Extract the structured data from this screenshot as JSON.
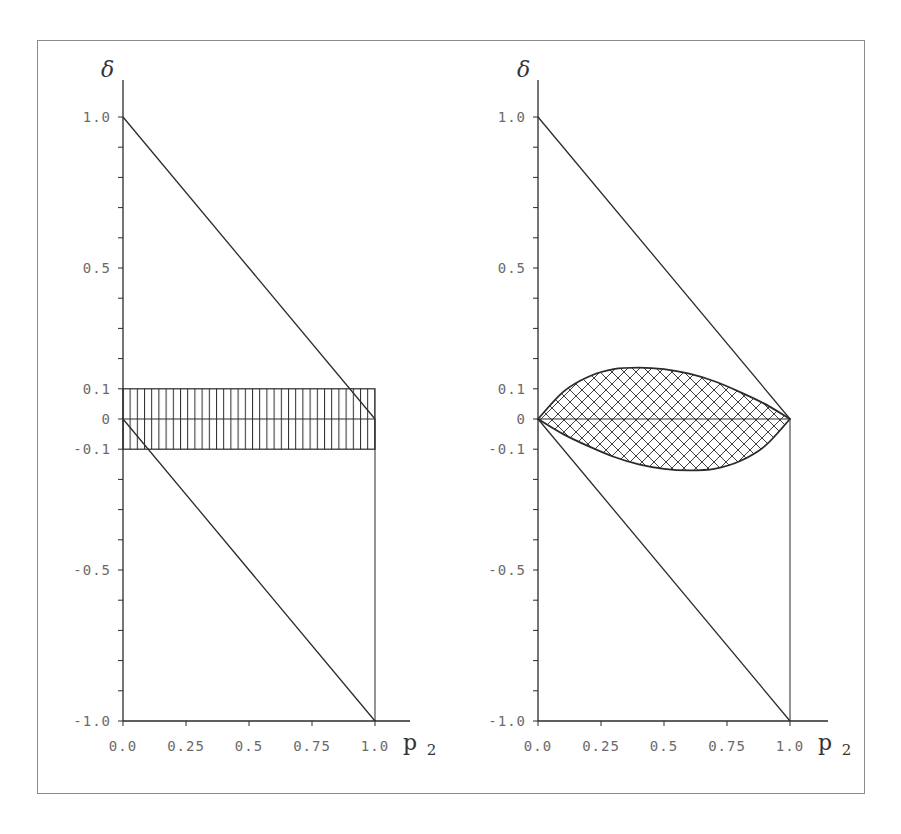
{
  "chart_data": [
    {
      "type": "area",
      "panel": "left",
      "title": "",
      "xlabel": "p2",
      "ylabel": "δ",
      "xlim": [
        0.0,
        1.0
      ],
      "ylim": [
        -1.0,
        1.0
      ],
      "xticks": [
        "0.0",
        "0.25",
        "0.5",
        "0.75",
        "1.0"
      ],
      "yticks_labeled": [
        "1.0",
        "0.5",
        "0.1",
        "0",
        "-0.1",
        "-0.5",
        "-1.0"
      ],
      "ytick_step": 0.1,
      "grid": false,
      "series": [
        {
          "name": "upper bound line",
          "x": [
            0.0,
            1.0
          ],
          "y": [
            1.0,
            0.0
          ]
        },
        {
          "name": "lower bound line",
          "x": [
            0.0,
            1.0
          ],
          "y": [
            0.0,
            -1.0
          ]
        },
        {
          "name": "zero line",
          "x": [
            0.0,
            1.0
          ],
          "y": [
            0.0,
            0.0
          ]
        },
        {
          "name": "vertical line p2=1",
          "x": [
            1.0,
            1.0
          ],
          "y": [
            0.0,
            -1.0
          ]
        }
      ],
      "shaded_regions": [
        {
          "name": "rectangular band (vertical hatch)",
          "shape": "rectangle",
          "x": [
            0.0,
            1.0
          ],
          "y": [
            -0.1,
            0.1
          ],
          "hatch": "vertical"
        }
      ]
    },
    {
      "type": "area",
      "panel": "right",
      "title": "",
      "xlabel": "p2",
      "ylabel": "δ",
      "xlim": [
        0.0,
        1.0
      ],
      "ylim": [
        -1.0,
        1.0
      ],
      "xticks": [
        "0.0",
        "0.25",
        "0.5",
        "0.75",
        "1.0"
      ],
      "yticks_labeled": [
        "1.0",
        "0.5",
        "0.1",
        "0",
        "-0.1",
        "-0.5",
        "-1.0"
      ],
      "ytick_step": 0.1,
      "grid": false,
      "series": [
        {
          "name": "upper bound line",
          "x": [
            0.0,
            1.0
          ],
          "y": [
            1.0,
            0.0
          ]
        },
        {
          "name": "lower bound line",
          "x": [
            0.0,
            1.0
          ],
          "y": [
            0.0,
            -1.0
          ]
        },
        {
          "name": "zero line",
          "x": [
            0.0,
            1.0
          ],
          "y": [
            0.0,
            0.0
          ]
        },
        {
          "name": "vertical line p2=1",
          "x": [
            1.0,
            1.0
          ],
          "y": [
            0.0,
            -1.0
          ]
        },
        {
          "name": "lens upper curve",
          "x": [
            0.0,
            0.1,
            0.2,
            0.3,
            0.4,
            0.5,
            0.6,
            0.7,
            0.8,
            0.9,
            1.0
          ],
          "y": [
            0.0,
            0.09,
            0.14,
            0.165,
            0.17,
            0.165,
            0.15,
            0.125,
            0.09,
            0.05,
            0.0
          ]
        },
        {
          "name": "lens lower curve",
          "x": [
            0.0,
            0.1,
            0.2,
            0.3,
            0.4,
            0.5,
            0.6,
            0.7,
            0.8,
            0.9,
            1.0
          ],
          "y": [
            0.0,
            -0.05,
            -0.09,
            -0.125,
            -0.15,
            -0.165,
            -0.17,
            -0.165,
            -0.14,
            -0.09,
            0.0
          ]
        }
      ],
      "shaded_regions": [
        {
          "name": "lens region (cross hatch)",
          "shape": "lens",
          "x": [
            0.0,
            1.0
          ],
          "y_range": [
            -0.17,
            0.17
          ],
          "hatch": "cross"
        }
      ]
    }
  ],
  "panels": {
    "left": {
      "ylabel": "δ",
      "xlabel_main": "p",
      "xlabel_sub": "2",
      "yticks": [
        {
          "label": "1.0",
          "value": 1.0
        },
        {
          "label": "0.5",
          "value": 0.5
        },
        {
          "label": "0.1",
          "value": 0.1
        },
        {
          "label": "0",
          "value": 0.0
        },
        {
          "label": "-0.1",
          "value": -0.1
        },
        {
          "label": "-0.5",
          "value": -0.5
        },
        {
          "label": "-1.0",
          "value": -1.0
        }
      ],
      "xticks": [
        {
          "label": "0.0",
          "value": 0.0
        },
        {
          "label": "0.25",
          "value": 0.25
        },
        {
          "label": "0.5",
          "value": 0.5
        },
        {
          "label": "0.75",
          "value": 0.75
        },
        {
          "label": "1.0",
          "value": 1.0
        }
      ]
    },
    "right": {
      "ylabel": "δ",
      "xlabel_main": "p",
      "xlabel_sub": "2",
      "yticks": [
        {
          "label": "1.0",
          "value": 1.0
        },
        {
          "label": "0.5",
          "value": 0.5
        },
        {
          "label": "0.1",
          "value": 0.1
        },
        {
          "label": "0",
          "value": 0.0
        },
        {
          "label": "-0.1",
          "value": -0.1
        },
        {
          "label": "-0.5",
          "value": -0.5
        },
        {
          "label": "-1.0",
          "value": -1.0
        }
      ],
      "xticks": [
        {
          "label": "0.0",
          "value": 0.0
        },
        {
          "label": "0.25",
          "value": 0.25
        },
        {
          "label": "0.5",
          "value": 0.5
        },
        {
          "label": "0.75",
          "value": 0.75
        },
        {
          "label": "1.0",
          "value": 1.0
        }
      ]
    }
  },
  "colors": {
    "line": "#2a2a2a",
    "tick_text": "#6a6a6a",
    "frame": "#8a8a8a"
  }
}
